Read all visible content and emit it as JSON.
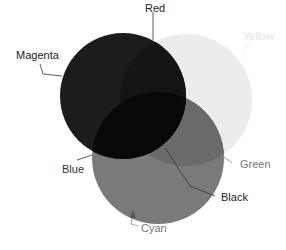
{
  "diagram": {
    "title": "",
    "type": "venn-color-mixing",
    "circles": [
      {
        "name": "Magenta",
        "cx": 123,
        "cy": 96,
        "r": 63,
        "fill": "#1c1c1c"
      },
      {
        "name": "Yellow",
        "cx": 186,
        "cy": 100,
        "r": 66,
        "fill": "#ececec"
      },
      {
        "name": "Cyan",
        "cx": 158,
        "cy": 158,
        "r": 66,
        "fill": "#7a7a7a"
      }
    ],
    "overlap_colors": {
      "red": "#0c0c0c",
      "green": "#6a6a6a",
      "blue": "#101010",
      "black": "#050505"
    },
    "labels": {
      "red": "Red",
      "magenta": "Magenta",
      "yellow": "Yellow",
      "blue": "Blue",
      "green": "Green",
      "black": "Black",
      "cyan": "Cyan"
    },
    "label_colors": {
      "dark": "#222222",
      "mid": "#777777",
      "faint": "#e4e4e4"
    }
  }
}
